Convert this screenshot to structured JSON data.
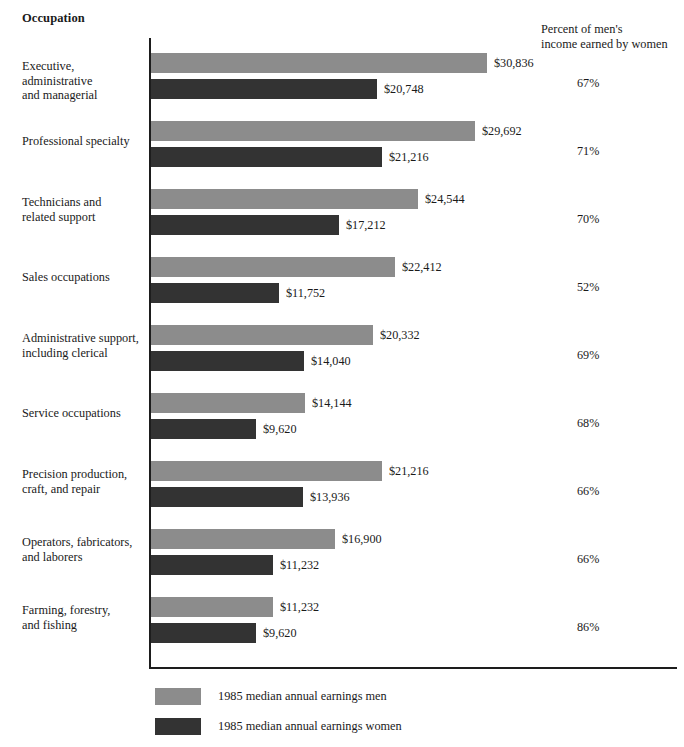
{
  "headers": {
    "occupation": "Occupation",
    "percent_line1": "Percent of men's",
    "percent_line2": "income earned by women"
  },
  "legend": {
    "men": "1985 median annual earnings men",
    "women": "1985 median annual earnings women"
  },
  "colors": {
    "men_bar": "#8c8c8c",
    "women_bar": "#333333",
    "axis": "#1d1d1d",
    "text": "#1a1a1a",
    "background": "#ffffff"
  },
  "chart_data": {
    "type": "bar",
    "title": "",
    "subtitle": "",
    "orientation": "horizontal",
    "grouped": true,
    "xlabel": "",
    "ylabel": "Occupation",
    "grid": false,
    "legend_position": "bottom-left",
    "xlim": [
      0,
      30836
    ],
    "axis_ticks": [],
    "categories": [
      "Executive, administrative and managerial",
      "Professional specialty",
      "Technicians and related support",
      "Sales occupations",
      "Administrative support, including clerical",
      "Service occupations",
      "Precision production, craft, and repair",
      "Operators, fabricators, and laborers",
      "Farming, forestry, and fishing"
    ],
    "series": [
      {
        "name": "1985 median annual earnings men",
        "color": "#8c8c8c",
        "values": [
          30836,
          29692,
          24544,
          22412,
          20332,
          14144,
          21216,
          16900,
          11232
        ],
        "labels": [
          "$30,836",
          "$29,692",
          "$24,544",
          "$22,412",
          "$20,332",
          "$14,144",
          "$21,216",
          "$16,900",
          "$11,232"
        ]
      },
      {
        "name": "1985 median annual earnings women",
        "color": "#333333",
        "values": [
          20748,
          21216,
          17212,
          11752,
          14040,
          9620,
          13936,
          11232,
          9620
        ],
        "labels": [
          "$20,748",
          "$21,216",
          "$17,212",
          "$11,752",
          "$14,040",
          "$9,620",
          "$13,936",
          "$11,232",
          "$9,620"
        ]
      }
    ],
    "annotations": {
      "column_title": "Percent of men's income earned by women",
      "values": [
        "67%",
        "71%",
        "70%",
        "52%",
        "69%",
        "68%",
        "66%",
        "66%",
        "86%"
      ]
    }
  },
  "rows": [
    {
      "label_line1": "Executive, administrative",
      "label_line2": "and managerial",
      "men_label": "$30,836",
      "women_label": "$20,748",
      "percent": "67%"
    },
    {
      "label_line1": "Professional specialty",
      "label_line2": "",
      "men_label": "$29,692",
      "women_label": "$21,216",
      "percent": "71%"
    },
    {
      "label_line1": "Technicians and",
      "label_line2": "related support",
      "men_label": "$24,544",
      "women_label": "$17,212",
      "percent": "70%"
    },
    {
      "label_line1": "Sales occupations",
      "label_line2": "",
      "men_label": "$22,412",
      "women_label": "$11,752",
      "percent": "52%"
    },
    {
      "label_line1": "Administrative support,",
      "label_line2": "including clerical",
      "men_label": "$20,332",
      "women_label": "$14,040",
      "percent": "69%"
    },
    {
      "label_line1": "Service occupations",
      "label_line2": "",
      "men_label": "$14,144",
      "women_label": "$9,620",
      "percent": "68%"
    },
    {
      "label_line1": "Precision production,",
      "label_line2": "craft, and repair",
      "men_label": "$21,216",
      "women_label": "$13,936",
      "percent": "66%"
    },
    {
      "label_line1": "Operators, fabricators,",
      "label_line2": "and laborers",
      "men_label": "$16,900",
      "women_label": "$11,232",
      "percent": "66%"
    },
    {
      "label_line1": "Farming, forestry,",
      "label_line2": "and fishing",
      "men_label": "$11,232",
      "women_label": "$9,620",
      "percent": "86%"
    }
  ]
}
